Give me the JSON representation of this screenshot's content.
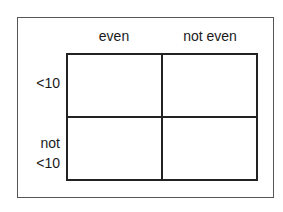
{
  "table": {
    "columns": [
      {
        "label": "even"
      },
      {
        "label": "not even"
      }
    ],
    "rows": [
      {
        "label_lines": [
          "<10"
        ]
      },
      {
        "label_lines": [
          "not",
          "<10"
        ]
      }
    ],
    "cells": [
      [
        "",
        ""
      ],
      [
        "",
        ""
      ]
    ]
  },
  "colors": {
    "line": "#222222",
    "frame": "#555555",
    "background": "#ffffff",
    "text": "#1a1a1a"
  }
}
